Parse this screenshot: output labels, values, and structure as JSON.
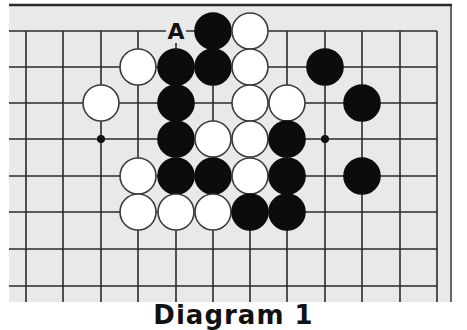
{
  "diagram": {
    "caption": "Diagram 1",
    "board": {
      "background": "#e9e9e9",
      "line_color": "#2a2a2a",
      "frame_color": "#2a2a2a",
      "columns_x": [
        26,
        63,
        101,
        138,
        176,
        213,
        250,
        287,
        325,
        362,
        400,
        437
      ],
      "rows_y": [
        31,
        67,
        103,
        139,
        176,
        212,
        249,
        286
      ],
      "stone_radius": 18,
      "star_points": [
        {
          "col": 2,
          "row": 3
        },
        {
          "col": 8,
          "row": 3
        }
      ],
      "labels": [
        {
          "text": "A",
          "col": 4,
          "row": 0
        }
      ],
      "stones": [
        {
          "color": "black",
          "col": 5,
          "row": 0
        },
        {
          "color": "white",
          "col": 6,
          "row": 0
        },
        {
          "color": "white",
          "col": 3,
          "row": 1
        },
        {
          "color": "black",
          "col": 4,
          "row": 1
        },
        {
          "color": "black",
          "col": 5,
          "row": 1
        },
        {
          "color": "white",
          "col": 6,
          "row": 1
        },
        {
          "color": "black",
          "col": 8,
          "row": 1
        },
        {
          "color": "white",
          "col": 2,
          "row": 2
        },
        {
          "color": "black",
          "col": 4,
          "row": 2
        },
        {
          "color": "white",
          "col": 6,
          "row": 2
        },
        {
          "color": "white",
          "col": 7,
          "row": 2
        },
        {
          "color": "black",
          "col": 9,
          "row": 2
        },
        {
          "color": "black",
          "col": 4,
          "row": 3
        },
        {
          "color": "white",
          "col": 5,
          "row": 3
        },
        {
          "color": "white",
          "col": 6,
          "row": 3
        },
        {
          "color": "black",
          "col": 7,
          "row": 3
        },
        {
          "color": "white",
          "col": 3,
          "row": 4
        },
        {
          "color": "black",
          "col": 4,
          "row": 4
        },
        {
          "color": "black",
          "col": 5,
          "row": 4
        },
        {
          "color": "white",
          "col": 6,
          "row": 4
        },
        {
          "color": "black",
          "col": 7,
          "row": 4
        },
        {
          "color": "black",
          "col": 9,
          "row": 4
        },
        {
          "color": "white",
          "col": 3,
          "row": 5
        },
        {
          "color": "white",
          "col": 4,
          "row": 5
        },
        {
          "color": "white",
          "col": 5,
          "row": 5
        },
        {
          "color": "black",
          "col": 6,
          "row": 5
        },
        {
          "color": "black",
          "col": 7,
          "row": 5
        }
      ]
    }
  }
}
